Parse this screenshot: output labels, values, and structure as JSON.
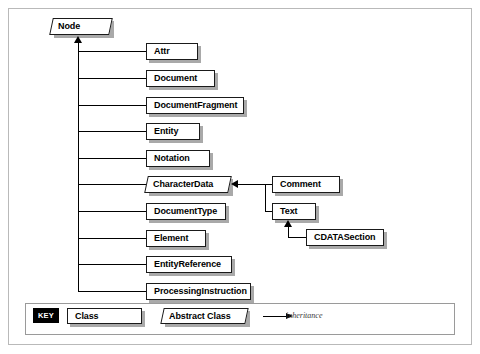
{
  "figure": {
    "root": {
      "name": "Node",
      "kind": "abstract-class"
    },
    "node_subclasses": [
      {
        "name": "Attr",
        "kind": "class"
      },
      {
        "name": "Document",
        "kind": "class"
      },
      {
        "name": "DocumentFragment",
        "kind": "class"
      },
      {
        "name": "Entity",
        "kind": "class"
      },
      {
        "name": "Notation",
        "kind": "class"
      },
      {
        "name": "CharacterData",
        "kind": "abstract-class"
      },
      {
        "name": "DocumentType",
        "kind": "class"
      },
      {
        "name": "Element",
        "kind": "class"
      },
      {
        "name": "EntityReference",
        "kind": "class"
      },
      {
        "name": "ProcessingInstruction",
        "kind": "class"
      }
    ],
    "characterdata_subclasses": [
      {
        "name": "Comment",
        "kind": "class"
      },
      {
        "name": "Text",
        "kind": "class"
      }
    ],
    "text_subclasses": [
      {
        "name": "CDATASection",
        "kind": "class"
      }
    ]
  },
  "key": {
    "badge": "KEY",
    "class_sample": "Class",
    "abstract_class_sample": "Abstract Class",
    "inheritance_label": "inheritance"
  },
  "colors": {
    "line": "#000000",
    "box_border": "#1a1a1a",
    "box_fill": "#ffffff",
    "shadow": "#9a9a9a",
    "frame": "#b9b9b9",
    "key_badge_bg": "#000000",
    "key_badge_fg": "#ffffff",
    "page_bg": "#ffffff"
  }
}
